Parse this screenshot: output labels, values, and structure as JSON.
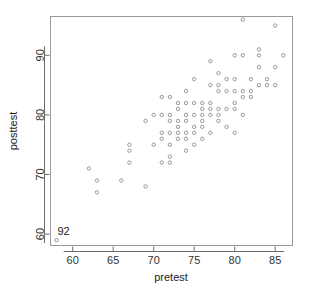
{
  "chart_data": {
    "type": "scatter",
    "title": "",
    "xlabel": "pretest",
    "ylabel": "posttest",
    "xlim": [
      57.2,
      87.2
    ],
    "ylim": [
      58.0,
      96.6
    ],
    "xticks": [
      60,
      65,
      70,
      75,
      80,
      85
    ],
    "yticks": [
      60,
      70,
      80,
      90
    ],
    "xticklabels": [
      "60",
      "65",
      "70",
      "75",
      "80",
      "85"
    ],
    "yticklabels": [
      "60",
      "70",
      "80",
      "90"
    ],
    "grid": false,
    "legend": null,
    "marker": "open-circle",
    "marker_color": "#8c8c9a",
    "annotations": [
      {
        "text": "92",
        "x": 58,
        "y": 60.5,
        "name": "point-label-92"
      }
    ],
    "x": [
      58,
      62,
      63,
      63,
      66,
      67,
      67,
      67,
      69,
      69,
      70,
      70,
      71,
      71,
      71,
      71,
      71,
      72,
      72,
      72,
      72,
      72,
      72,
      72,
      73,
      73,
      73,
      73,
      73,
      73,
      74,
      74,
      74,
      74,
      74,
      74,
      74,
      75,
      75,
      75,
      75,
      75,
      75,
      76,
      76,
      76,
      76,
      76,
      76,
      77,
      77,
      77,
      77,
      77,
      77,
      78,
      78,
      78,
      78,
      78,
      78,
      79,
      79,
      79,
      79,
      80,
      80,
      80,
      80,
      80,
      80,
      81,
      81,
      81,
      81,
      81,
      82,
      82,
      82,
      83,
      83,
      83,
      83,
      84,
      84,
      85,
      85,
      85,
      86
    ],
    "y": [
      59,
      71,
      67,
      69,
      69,
      72,
      74,
      75,
      68,
      79,
      75,
      80,
      72,
      76,
      77,
      80,
      83,
      72,
      73,
      75,
      77,
      79,
      80,
      83,
      76,
      77,
      78,
      79,
      81,
      82,
      74,
      76,
      77,
      79,
      80,
      82,
      84,
      75,
      77,
      78,
      80,
      82,
      86,
      76,
      78,
      79,
      80,
      81,
      82,
      77,
      80,
      81,
      82,
      85,
      89,
      79,
      80,
      81,
      84,
      85,
      87,
      78,
      81,
      84,
      86,
      77,
      81,
      82,
      84,
      86,
      90,
      80,
      83,
      84,
      90,
      96,
      83,
      84,
      86,
      85,
      88,
      90,
      91,
      85,
      86,
      85,
      88,
      95,
      90
    ]
  },
  "figure": {
    "plot_box": {
      "left": 50,
      "top": 16,
      "right": 293,
      "bottom": 246
    }
  }
}
